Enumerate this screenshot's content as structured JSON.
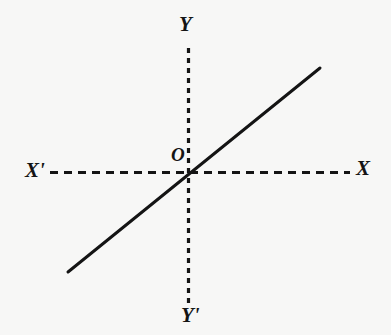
{
  "figure": {
    "kind": "cartesian-axes-line-graph",
    "background_color": "#f7f7f6",
    "ink_color": "#141414",
    "width": 391,
    "height": 335
  },
  "labels": {
    "y_positive": "Y",
    "y_negative": "Y'",
    "x_positive": "X",
    "x_negative": "X'",
    "origin": "O"
  },
  "chart_data": {
    "type": "line",
    "title": "",
    "xlabel": "X",
    "ylabel": "Y",
    "grid": false,
    "legend": null,
    "axes": {
      "x_axis": {
        "label_positive": "X",
        "label_negative": "X'",
        "style": "dashed",
        "y_pixel": 172,
        "x_start_pixel": 50,
        "x_end_pixel": 350,
        "dash_length": 8,
        "gap_length": 6,
        "stroke_width": 3
      },
      "y_axis": {
        "label_positive": "Y",
        "label_negative": "Y'",
        "style": "dotted",
        "x_pixel": 188,
        "y_start_pixel": 48,
        "y_end_pixel": 306,
        "dash_length": 5,
        "gap_length": 5,
        "stroke_width": 3
      },
      "origin": {
        "label": "O",
        "x_pixel": 188,
        "y_pixel": 172
      }
    },
    "series": [
      {
        "name": "line-through-origin",
        "style": "solid",
        "stroke_width": 3,
        "points_pixel": [
          [
            68,
            272
          ],
          [
            320,
            68
          ]
        ],
        "x": [
          -1.0,
          1.0
        ],
        "values": [
          -0.75,
          0.75
        ],
        "passes_through_origin": true,
        "slope_sign": "positive"
      }
    ],
    "xlim": [
      -1.1,
      1.25
    ],
    "ylim": [
      -1.0,
      0.95
    ]
  }
}
